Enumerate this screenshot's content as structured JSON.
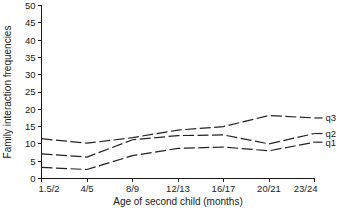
{
  "chart_data": {
    "type": "line",
    "title": "",
    "xlabel": "Age of second child (months)",
    "ylabel": "Family interaction frequencies",
    "categories": [
      "1.5/2",
      "4/5",
      "8/9",
      "12/13",
      "16/17",
      "20/21",
      "23/24"
    ],
    "ylim": [
      0,
      50
    ],
    "yticks": [
      0,
      5,
      10,
      15,
      20,
      25,
      30,
      35,
      40,
      45,
      50
    ],
    "grid": false,
    "legend_position": "right-inline",
    "series": [
      {
        "name": "q3",
        "values": [
          11.5,
          10.2,
          11.8,
          14.0,
          15.0,
          18.2,
          17.5
        ]
      },
      {
        "name": "q2",
        "values": [
          7.1,
          6.2,
          11.2,
          12.4,
          12.6,
          10.0,
          13.0
        ]
      },
      {
        "name": "q1",
        "values": [
          3.2,
          2.6,
          6.6,
          8.7,
          9.1,
          8.0,
          10.5
        ]
      }
    ]
  },
  "axes": {
    "y_tick_labels": [
      "50",
      "45",
      "40",
      "35",
      "30",
      "25",
      "20",
      "15",
      "10",
      "5",
      "0"
    ],
    "x_tick_labels": [
      "1.5/2",
      "4/5",
      "8/9",
      "12/13",
      "16/17",
      "20/21",
      "23/24"
    ],
    "y_title": "Family interaction frequencies",
    "x_title": "Age of second child (months)"
  },
  "series_labels": {
    "q3": "q3",
    "q2": "q2",
    "q1": "q1"
  },
  "colors": {
    "line": "#222222",
    "axis": "#1a1a1a",
    "background": "#ffffff"
  }
}
